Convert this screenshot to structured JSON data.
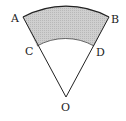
{
  "diagram": {
    "type": "annular-sector",
    "points": {
      "A": {
        "label": "A",
        "x": 23,
        "y": 17
      },
      "B": {
        "label": "B",
        "x": 109,
        "y": 17
      },
      "C": {
        "label": "C",
        "x": 37,
        "y": 46
      },
      "D": {
        "label": "D",
        "x": 94,
        "y": 46
      },
      "O": {
        "label": "O",
        "x": 66,
        "y": 97
      }
    },
    "outer_radius": 90,
    "inner_radius": 58,
    "colors": {
      "stroke": "#222222",
      "shade": "#c8c8c8",
      "background": "#ffffff"
    }
  }
}
